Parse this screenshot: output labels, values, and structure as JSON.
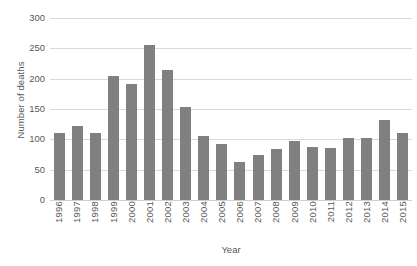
{
  "chart_data": {
    "type": "bar",
    "title": "",
    "xlabel": "Year",
    "ylabel": "Number of deaths",
    "categories": [
      "1996",
      "1997",
      "1998",
      "1999",
      "2000",
      "2001",
      "2002",
      "2003",
      "2004",
      "2005",
      "2006",
      "2007",
      "2008",
      "2009",
      "2010",
      "2011",
      "2012",
      "2013",
      "2014",
      "2015"
    ],
    "values": [
      110,
      122,
      110,
      204,
      191,
      255,
      215,
      154,
      105,
      92,
      63,
      75,
      84,
      97,
      88,
      86,
      103,
      103,
      132,
      110
    ],
    "series": [
      {
        "name": "Number of deaths",
        "values": [
          110,
          122,
          110,
          204,
          191,
          255,
          215,
          154,
          105,
          92,
          63,
          75,
          84,
          97,
          88,
          86,
          103,
          103,
          132,
          110
        ]
      }
    ],
    "ylim": [
      0,
      300
    ],
    "ytick_values": [
      0,
      50,
      100,
      150,
      200,
      250,
      300
    ],
    "ytick_labels": [
      "0",
      "50",
      "100",
      "150",
      "200",
      "250",
      "300"
    ],
    "grid": true,
    "legend": false,
    "bar_color": "#808080",
    "gridline_color": "#d9d9d9",
    "text_color": "#595959"
  }
}
